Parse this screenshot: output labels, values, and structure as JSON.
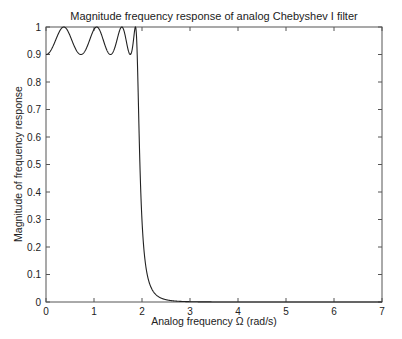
{
  "chart_data": {
    "type": "line",
    "title": "Magnitude frequency response of analog Chebyshev I filter",
    "xlabel": "Analog frequency Ω (rad/s)",
    "ylabel": "Magnitude of frequency response",
    "xlim": [
      0,
      7
    ],
    "ylim": [
      0,
      1
    ],
    "xticks": [
      "0",
      "1",
      "2",
      "3",
      "4",
      "5",
      "6",
      "7"
    ],
    "yticks": [
      "0",
      "0.1",
      "0.2",
      "0.3",
      "0.4",
      "0.5",
      "0.6",
      "0.7",
      "0.8",
      "0.9",
      "1"
    ],
    "grid": false,
    "legend": null,
    "series": [
      {
        "name": "|H(jΩ)|",
        "filter": {
          "type": "Chebyshev I",
          "order": 8,
          "passband_edge": 1.9,
          "ripple_min": 0.9
        },
        "x": [
          0,
          0.35,
          0.7,
          1.0,
          1.32,
          1.55,
          1.72,
          1.85,
          1.9,
          2.0,
          2.1,
          2.2,
          2.4,
          2.6,
          3.0,
          4.0,
          7.0
        ],
        "values": [
          0.9,
          1.0,
          0.9,
          1.0,
          0.9,
          1.0,
          0.9,
          1.0,
          0.9,
          0.42,
          0.17,
          0.08,
          0.025,
          0.01,
          0.002,
          0.0,
          0.0
        ]
      }
    ]
  }
}
